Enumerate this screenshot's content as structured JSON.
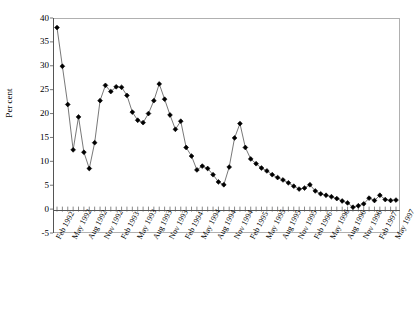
{
  "chart_data": {
    "type": "line",
    "title": "",
    "xlabel": "",
    "ylabel": "Per cent",
    "ylim": [
      -5,
      40
    ],
    "ytick_values": [
      40,
      35,
      30,
      25,
      20,
      15,
      10,
      5,
      0,
      -5
    ],
    "ytick_labels": [
      "40",
      "35",
      "30",
      "25",
      "20",
      "15",
      "10",
      "5",
      "0",
      "-5"
    ],
    "grid": false,
    "legend": "none",
    "marker": "diamond",
    "marker_color": "#000000",
    "line_color": "#555555",
    "x_tick_labels": [
      "Feb 1992",
      "May 1992",
      "Aug 1992",
      "Nov 1992",
      "Feb 1993",
      "May 1993",
      "Aug 1993",
      "Nov 1993",
      "Feb 1994",
      "May 1994",
      "Aug 1994",
      "Nov 1994",
      "Feb 1995",
      "May 1995",
      "Aug 1995",
      "Nov 1995",
      "Feb 1996",
      "May 1996",
      "Aug 1996",
      "Nov 1996",
      "Feb 1997",
      "May 1997"
    ],
    "x_tick_step_months": 3,
    "x_start": "Feb 1992",
    "x_end": "May 1997",
    "n_points": 64,
    "values": [
      38.0,
      29.9,
      21.9,
      12.4,
      19.3,
      11.9,
      8.5,
      13.9,
      22.7,
      25.9,
      24.6,
      25.6,
      25.5,
      23.8,
      20.3,
      18.6,
      18.1,
      20.0,
      22.7,
      26.2,
      23.0,
      19.7,
      16.7,
      18.4,
      12.9,
      11.1,
      8.2,
      9.0,
      8.5,
      7.2,
      5.7,
      5.1,
      8.8,
      14.9,
      17.9,
      12.9,
      10.5,
      9.5,
      8.6,
      8.0,
      7.2,
      6.6,
      6.1,
      5.5,
      4.8,
      4.2,
      4.4,
      5.1,
      3.8,
      3.2,
      2.9,
      2.6,
      2.2,
      1.7,
      1.3,
      0.4,
      0.7,
      1.1,
      2.3,
      1.8,
      2.9,
      2.0,
      1.8,
      1.9
    ]
  }
}
